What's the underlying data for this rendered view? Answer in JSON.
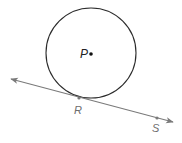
{
  "diagram": {
    "colors": {
      "circle": "#2b2b2b",
      "center_point": "#111111",
      "line": "#7a7a7a",
      "point_label_dark": "#222222",
      "point_label_gray": "#6e6e6e"
    },
    "circle": {
      "cx": 91,
      "cy": 53,
      "r": 45
    },
    "center": {
      "label": "P",
      "x": 91,
      "y": 54,
      "label_x": 80,
      "label_y": 58
    },
    "line": {
      "type": "line-with-arrows",
      "x1": 11,
      "y1": 79,
      "x2": 173,
      "y2": 122
    },
    "points": [
      {
        "label": "R",
        "x": 79,
        "y": 98,
        "label_x": 74,
        "label_y": 114
      },
      {
        "label": "S",
        "x": 157,
        "y": 118,
        "label_x": 152,
        "label_y": 132
      }
    ]
  }
}
